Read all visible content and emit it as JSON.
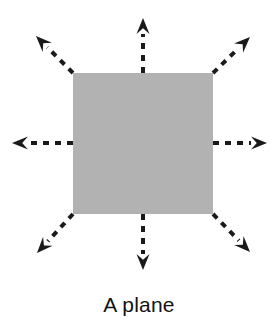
{
  "figure": {
    "caption": "A plane",
    "background_color": "#ffffff",
    "plane": {
      "label": "plane-square",
      "fill_color": "#b2b2b2",
      "x": 73,
      "y": 73,
      "width": 140,
      "height": 141
    },
    "arrow_style": {
      "color": "#1a1a1a",
      "line_style": "dashed",
      "dash_pattern": "6 6",
      "stroke_width": 4,
      "head_length": 16,
      "head_width": 13
    },
    "arrows": [
      {
        "name": "arrow-up",
        "direction": "up",
        "from_x": 143,
        "from_y": 73,
        "to_x": 143,
        "to_y": 18
      },
      {
        "name": "arrow-down",
        "direction": "down",
        "from_x": 143,
        "from_y": 214,
        "to_x": 143,
        "to_y": 270
      },
      {
        "name": "arrow-left",
        "direction": "left",
        "from_x": 73,
        "from_y": 143,
        "to_x": 12,
        "to_y": 143
      },
      {
        "name": "arrow-right",
        "direction": "right",
        "from_x": 213,
        "from_y": 143,
        "to_x": 267,
        "to_y": 143
      },
      {
        "name": "arrow-up-left",
        "direction": "up-left",
        "from_x": 73,
        "from_y": 73,
        "to_x": 36,
        "to_y": 36
      },
      {
        "name": "arrow-up-right",
        "direction": "up-right",
        "from_x": 213,
        "from_y": 73,
        "to_x": 250,
        "to_y": 37
      },
      {
        "name": "arrow-down-left",
        "direction": "down-left",
        "from_x": 73,
        "from_y": 214,
        "to_x": 37,
        "to_y": 253
      },
      {
        "name": "arrow-down-right",
        "direction": "down-right",
        "from_x": 213,
        "from_y": 214,
        "to_x": 250,
        "to_y": 252
      }
    ]
  }
}
